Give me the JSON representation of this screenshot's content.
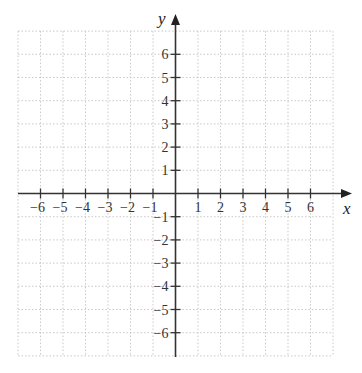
{
  "chart_data": {
    "type": "scatter",
    "title": "",
    "xlabel": "x",
    "ylabel": "y",
    "xlim": [
      -7,
      7
    ],
    "ylim": [
      -7,
      7
    ],
    "grid": true,
    "grid_style": "dotted",
    "x_ticks": [
      -6,
      -5,
      -4,
      -3,
      -2,
      -1,
      1,
      2,
      3,
      4,
      5,
      6
    ],
    "y_ticks": [
      -6,
      -5,
      -4,
      -3,
      -2,
      -1,
      1,
      2,
      3,
      4,
      5,
      6
    ],
    "x_tick_labels": [
      "−6",
      "−5",
      "−4",
      "−3",
      "−2",
      "−1",
      "1",
      "2",
      "3",
      "4",
      "5",
      "6"
    ],
    "y_tick_labels": [
      "−6",
      "−5",
      "−4",
      "−3",
      "−2",
      "−1",
      "1",
      "2",
      "3",
      "4",
      "5",
      "6"
    ],
    "series": [],
    "legend": null
  },
  "colors": {
    "axis": "#333333",
    "grid": "#bbbbbb",
    "text": "#333333",
    "background": "#ffffff"
  }
}
